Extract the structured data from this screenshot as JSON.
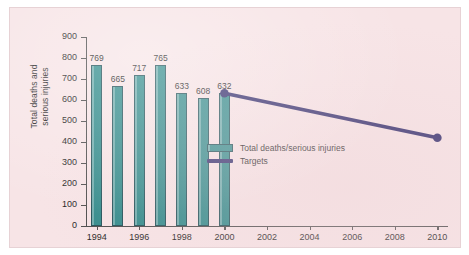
{
  "figure": {
    "background_color": "#f7e4e6",
    "bar_color": "#2e8a8a",
    "target_color": "#2e2a6b",
    "axis_color": "#4a4a4a"
  },
  "chart_data": {
    "type": "bar",
    "title": "",
    "xlabel": "",
    "ylabel": "Total deaths and\nserious injuries",
    "ylim": [
      0,
      900
    ],
    "xlim": [
      1993.5,
      2010.5
    ],
    "grid": false,
    "legend_position": "center-right",
    "y_ticks": [
      "0",
      "100",
      "200",
      "300",
      "400",
      "500",
      "600",
      "700",
      "800",
      "900"
    ],
    "y_tick_values": [
      0,
      100,
      200,
      300,
      400,
      500,
      600,
      700,
      800,
      900
    ],
    "x_ticks": [
      "1994",
      "1996",
      "1998",
      "2000",
      "2002",
      "2004",
      "2006",
      "2008",
      "2010"
    ],
    "x_tick_values": [
      1994,
      1996,
      1998,
      2000,
      2002,
      2004,
      2006,
      2008,
      2010
    ],
    "categories": [
      1994,
      1995,
      1996,
      1997,
      1998,
      1999,
      2000
    ],
    "values": [
      769,
      665,
      717,
      765,
      633,
      608,
      632
    ],
    "bar_labels": [
      "769",
      "665",
      "717",
      "765",
      "633",
      "608",
      "632"
    ],
    "series": [
      {
        "name": "Total deaths/serious injuries",
        "type": "bar",
        "color": "#2e8a8a",
        "x": [
          1994,
          1995,
          1996,
          1997,
          1998,
          1999,
          2000
        ],
        "values": [
          769,
          665,
          717,
          765,
          633,
          608,
          632
        ]
      },
      {
        "name": "Targets",
        "type": "line",
        "color": "#2e2a6b",
        "x": [
          2000,
          2010
        ],
        "values": [
          632,
          420
        ],
        "markers": [
          {
            "x": 2000,
            "y": 632,
            "label": "632"
          },
          {
            "x": 2010,
            "y": 420,
            "label": ""
          }
        ]
      }
    ]
  },
  "legend": {
    "items": [
      {
        "label": "Total deaths/serious injuries",
        "marker": "bar-swatch",
        "color": "#2e8a8a"
      },
      {
        "label": "Targets",
        "marker": "line-swatch",
        "color": "#2e2a6b"
      }
    ]
  }
}
